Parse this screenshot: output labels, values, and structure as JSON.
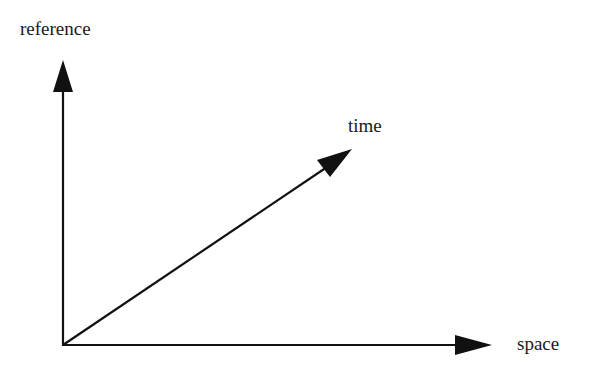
{
  "diagram": {
    "labels": {
      "y_axis": "reference",
      "diagonal": "time",
      "x_axis": "space"
    },
    "colors": {
      "stroke": "#111111",
      "background": "#ffffff"
    }
  }
}
